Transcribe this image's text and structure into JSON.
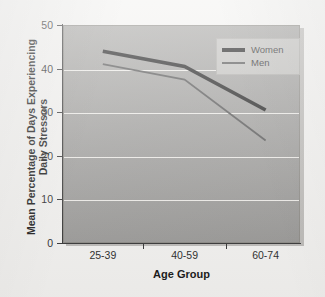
{
  "chart_data": {
    "type": "line",
    "title": "",
    "xlabel": "Age Group",
    "ylabel": "Mean Percentage of Days Experiencing Daily Stressors",
    "ylabel_line1": "Mean Percentage of Days Experiencing",
    "ylabel_line2": "Daily Stressors",
    "categories": [
      "25-39",
      "40-59",
      "60-74"
    ],
    "series": [
      {
        "name": "Women",
        "values": [
          44,
          40.5,
          30.5
        ],
        "color": "#111111",
        "width": 3.6
      },
      {
        "name": "Men",
        "values": [
          41,
          37.5,
          23.5
        ],
        "color": "#4b4b4b",
        "width": 1.8
      }
    ],
    "ylim": [
      0,
      50
    ],
    "yticks": [
      0,
      10,
      20,
      30,
      40,
      50
    ],
    "ytick_labels": [
      "0",
      "10",
      "20",
      "30",
      "40",
      "50"
    ],
    "gridlines": [
      10,
      20,
      30,
      40
    ],
    "grid": true,
    "grid_color": "#eceae6",
    "legend_position": "top-right-inside",
    "plot_background": "#9b9a98",
    "page_background": "#f2f1ef"
  },
  "legend": {
    "entries": [
      {
        "label": "Women"
      },
      {
        "label": "Men"
      }
    ]
  }
}
